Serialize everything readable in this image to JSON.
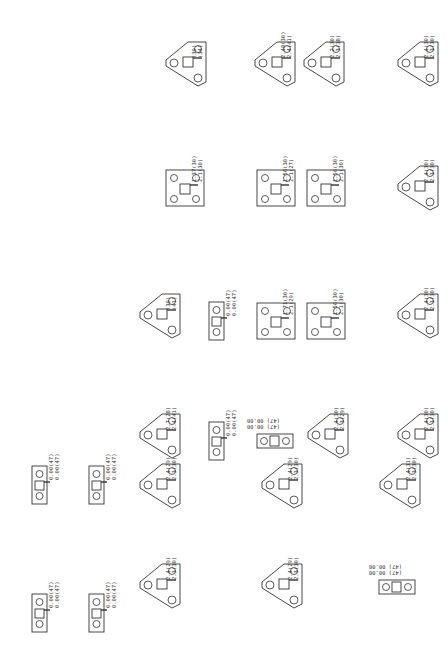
{
  "drawing": {
    "stroke_color": "#333333",
    "background": "#ffffff"
  },
  "parts": [
    {
      "id": "p1",
      "type": "triangle",
      "x": 162,
      "y": 38,
      "labels": [
        "(30)",
        "(34)"
      ]
    },
    {
      "id": "p2",
      "type": "triangle",
      "x": 251,
      "y": 38,
      "labels": [
        "2.48(30)",
        "2.4(41)"
      ]
    },
    {
      "id": "p3",
      "type": "triangle",
      "x": 300,
      "y": 38,
      "labels": [
        "2.2(30)",
        "2.3(38)"
      ]
    },
    {
      "id": "p4",
      "type": "triangle",
      "x": 394,
      "y": 38,
      "labels": [
        "2.4(30)",
        "2.3(30)"
      ]
    },
    {
      "id": "p5",
      "type": "square",
      "x": 164,
      "y": 162,
      "labels": [
        "1.37(30)",
        "2.1(30)"
      ]
    },
    {
      "id": "p6",
      "type": "square",
      "x": 255,
      "y": 162,
      "labels": [
        "1.56(30)",
        "2.1(27)"
      ]
    },
    {
      "id": "p7",
      "type": "square",
      "x": 305,
      "y": 162,
      "labels": [
        "1.56(30)",
        "2.1(30)"
      ]
    },
    {
      "id": "p8",
      "type": "triangle",
      "x": 394,
      "y": 162,
      "labels": [
        "2.4(30)",
        "2.3(30)"
      ]
    },
    {
      "id": "p9",
      "type": "triangle",
      "x": 136,
      "y": 290,
      "labels": [
        "(30)",
        "(41)"
      ]
    },
    {
      "id": "p10",
      "type": "slim",
      "x": 208,
      "y": 298,
      "labels": [
        "0.00(47)",
        "0.00(47)"
      ]
    },
    {
      "id": "p11",
      "type": "square",
      "x": 255,
      "y": 295,
      "labels": [
        "1.71(30)",
        "2.1(29)"
      ]
    },
    {
      "id": "p12",
      "type": "square",
      "x": 305,
      "y": 295,
      "labels": [
        "1.56(30)",
        "2.1(30)"
      ]
    },
    {
      "id": "p13",
      "type": "triangle",
      "x": 394,
      "y": 290,
      "labels": [
        "2.4(30)",
        "2.3(30)"
      ]
    },
    {
      "id": "p14",
      "type": "triangle",
      "x": 136,
      "y": 410,
      "labels": [
        "2.7(28)",
        "2.4(41)"
      ]
    },
    {
      "id": "p15",
      "type": "slim",
      "x": 208,
      "y": 418,
      "labels": [
        "0.00(47)",
        "0.00(47)"
      ]
    },
    {
      "id": "p16",
      "type": "slim-h",
      "x": 256,
      "y": 432,
      "labels": [
        "(47) 00.00",
        "(47) 00.00"
      ]
    },
    {
      "id": "p17",
      "type": "triangle",
      "x": 304,
      "y": 410,
      "labels": [
        "2.4(30)",
        "2.3(29)"
      ]
    },
    {
      "id": "p18",
      "type": "triangle",
      "x": 394,
      "y": 410,
      "labels": [
        "2.4(30)",
        "2.3(30)"
      ]
    },
    {
      "id": "p19",
      "type": "triangle",
      "x": 136,
      "y": 460,
      "labels": [
        "2.4(29)",
        "2.3(30)"
      ]
    },
    {
      "id": "p20",
      "type": "triangle",
      "x": 258,
      "y": 460,
      "labels": [
        "2.4(29)",
        "2.3(30)"
      ]
    },
    {
      "id": "p21",
      "type": "triangle",
      "x": 376,
      "y": 460,
      "labels": [
        "2.4(31)",
        "2.3(30)"
      ]
    },
    {
      "id": "p22",
      "type": "slim",
      "x": 31,
      "y": 462,
      "labels": [
        "0.00(47)",
        "0.00(47)"
      ]
    },
    {
      "id": "p23",
      "type": "slim",
      "x": 88,
      "y": 462,
      "labels": [
        "0.00(47)",
        "0.00(47)"
      ]
    },
    {
      "id": "p24",
      "type": "triangle",
      "x": 136,
      "y": 560,
      "labels": [
        "2.4(29)",
        "2.3(30)"
      ]
    },
    {
      "id": "p25",
      "type": "triangle",
      "x": 258,
      "y": 560,
      "labels": [
        "2.4(29)",
        "2.3(30)"
      ]
    },
    {
      "id": "p26",
      "type": "slim-h",
      "x": 378,
      "y": 578,
      "labels": [
        "(47) 00.00",
        "(47) 00.00"
      ]
    },
    {
      "id": "p27",
      "type": "slim",
      "x": 31,
      "y": 590,
      "labels": [
        "0.00(47)",
        "0.00(47)"
      ]
    },
    {
      "id": "p28",
      "type": "slim",
      "x": 88,
      "y": 590,
      "labels": [
        "0.00(47)",
        "0.00(47)"
      ]
    }
  ]
}
